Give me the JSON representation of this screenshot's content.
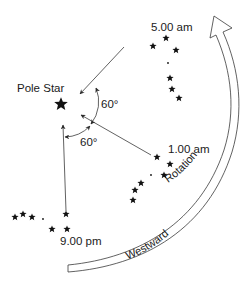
{
  "diagram": {
    "pole_star": {
      "label": "Pole Star",
      "glyph": "★"
    },
    "angles": [
      {
        "label": "60°",
        "between": [
          "5.00 am",
          "1.00 am"
        ]
      },
      {
        "label": "60°",
        "between": [
          "1.00 am",
          "9.00 pm"
        ]
      }
    ],
    "positions": [
      {
        "time": "5.00 am"
      },
      {
        "time": "1.00 am"
      },
      {
        "time": "9.00 pm"
      }
    ],
    "rotation_arrow": {
      "label_upper": "Rotation",
      "label_lower": "Westward",
      "icon": "curved-hollow-arrow-icon"
    },
    "colors": {
      "ink": "#1a1a1a",
      "line": "#3a3a3a",
      "background": "#ffffff"
    }
  }
}
